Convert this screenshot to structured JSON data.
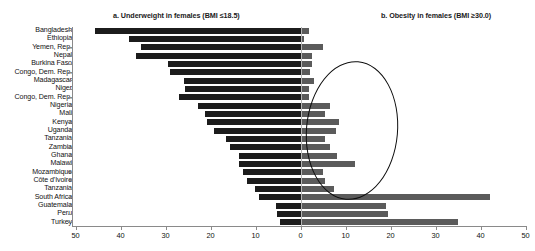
{
  "chart_data": {
    "type": "bar",
    "title": "",
    "orientation": "horizontal-diverging",
    "panels": [
      {
        "id": "a",
        "title": "a. Underweight in females (BMI ≤18.5)",
        "direction": "left",
        "xlabel": "",
        "xlim": [
          0,
          50
        ],
        "ticks": [
          50,
          40,
          30,
          20,
          10,
          0
        ],
        "color": "#1c1c1c"
      },
      {
        "id": "b",
        "title": "b. Obesity in females (BMI ≥30.0)",
        "direction": "right",
        "xlabel": "",
        "xlim": [
          0,
          50
        ],
        "ticks": [
          0,
          10,
          20,
          30,
          40,
          50
        ],
        "color": "#5b5b5b"
      }
    ],
    "categories": [
      "Bangladesh",
      "Ethiopia",
      "Yemen, Rep.",
      "Nepal",
      "Burkina Faso",
      "Congo, Dem. Rep.",
      "Madagascar",
      "Niger",
      "Congo, Dem. Rep.",
      "Nigeria",
      "Mali",
      "Kenya",
      "Uganda",
      "Tanzania",
      "Zambia",
      "Ghana",
      "Malawi",
      "Mozambique",
      "Côte d'Ivoire",
      "Tanzania",
      "South Africa",
      "Guatemala",
      "Peru",
      "Turkey"
    ],
    "series": [
      {
        "name": "Underweight in females (BMI ≤18.5)",
        "panel": "a",
        "values": [
          45.8,
          38.2,
          35.5,
          36.5,
          29.5,
          29.0,
          26.0,
          25.8,
          27.0,
          22.8,
          21.2,
          20.8,
          19.2,
          16.5,
          15.8,
          13.8,
          13.6,
          12.8,
          12.0,
          10.2,
          9.2,
          5.5,
          5.2,
          4.5
        ]
      },
      {
        "name": "Obesity in females (BMI ≥30.0)",
        "panel": "b",
        "values": [
          1.8,
          0.8,
          5.0,
          2.5,
          2.5,
          2.0,
          3.0,
          1.9,
          1.8,
          6.5,
          5.5,
          8.5,
          7.8,
          5.5,
          6.5,
          8.2,
          12.0,
          5.0,
          5.5,
          7.5,
          42.0,
          19.0,
          19.5,
          35.0
        ]
      }
    ],
    "annotations": [
      {
        "type": "ellipse",
        "name": "highlight-ellipse",
        "panel": "b",
        "x_range": [
          1.0,
          21.5
        ],
        "y_range_categories": [
          "Nepal",
          "Tanzania"
        ]
      }
    ],
    "grid": false,
    "legend": "none"
  }
}
